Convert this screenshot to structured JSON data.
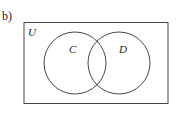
{
  "part_label": "b)",
  "diagram": {
    "type": "venn",
    "universal_set_label": "U",
    "sets": [
      {
        "label": "C"
      },
      {
        "label": "D"
      }
    ],
    "stroke_color": "#333333"
  }
}
